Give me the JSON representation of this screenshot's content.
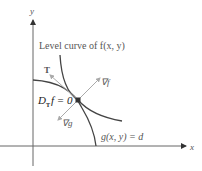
{
  "axes": {
    "x_label": "x",
    "y_label": "y"
  },
  "labels": {
    "level_curve": "Level curve of f(x, y)",
    "tangent": "T",
    "grad_f": "∇f",
    "grad_g": "∇g",
    "directional_derivative": "D",
    "directional_sub": "T",
    "directional_eq": "f = 0",
    "constraint": "g(x, y) = d"
  },
  "colors": {
    "curve": "#444444",
    "vector": "#999999",
    "axis": "#555555",
    "point": "#333333"
  }
}
